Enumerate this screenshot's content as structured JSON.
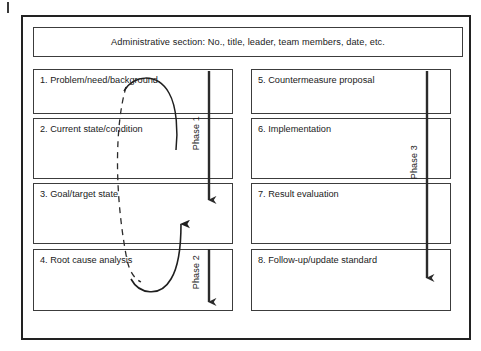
{
  "diagram": {
    "admin": {
      "text": "Administrative section: No., title, leader, team members, date, etc."
    },
    "left_column": {
      "name": "left-column",
      "boxes": [
        {
          "id": "box-1",
          "label": "1. Problem/need/background"
        },
        {
          "id": "box-2",
          "label": "2. Current state/condition"
        },
        {
          "id": "box-3",
          "label": "3. Goal/target state"
        },
        {
          "id": "box-4",
          "label": "4. Root cause analysis"
        }
      ]
    },
    "right_column": {
      "name": "right-column",
      "boxes": [
        {
          "id": "box-5",
          "label": "5. Countermeasure proposal"
        },
        {
          "id": "box-6",
          "label": "6. Implementation"
        },
        {
          "id": "box-7",
          "label": "7. Result evaluation"
        },
        {
          "id": "box-8",
          "label": "8. Follow-up/update standard"
        }
      ]
    },
    "phases": [
      {
        "id": "phase-1",
        "label": "Phase 1",
        "covers": [
          "1. Problem/need/background",
          "2. Current state/condition",
          "3. Goal/target state"
        ]
      },
      {
        "id": "phase-2",
        "label": "Phase 2",
        "covers": [
          "4. Root cause analysis"
        ]
      },
      {
        "id": "phase-3",
        "label": "Phase 3",
        "covers": [
          "5. Countermeasure proposal",
          "6. Implementation",
          "7. Result evaluation",
          "8. Follow-up/update standard"
        ]
      }
    ],
    "loop_annotation": {
      "name": "iteration-loop",
      "description": "Dashed-and-solid elliptical feedback loop linking boxes 1-4",
      "upper_arrow_direction": "down",
      "lower_arrow_direction": "up"
    },
    "colors": {
      "frame": "#222222",
      "box_border": "#3c3c3c",
      "arrow": "#2b2b2b",
      "text": "#1a1a1a",
      "background": "#ffffff"
    }
  }
}
